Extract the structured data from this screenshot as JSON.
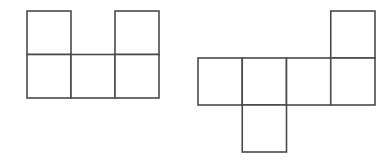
{
  "canvas": {
    "width": 388,
    "height": 165,
    "background_color": "#ffffff"
  },
  "style": {
    "stroke_color": "#4a4a4a",
    "fill_color": "#ffffff",
    "stroke_width": 1.6,
    "cell_size": 44
  },
  "figures": [
    {
      "name": "left-net",
      "label": "",
      "square_count": 5,
      "origin_x": 27,
      "origin_y": 11,
      "cell_width": 44,
      "cell_height": 43.5,
      "grid_cells": [
        {
          "col": 0,
          "row": 0
        },
        {
          "col": 2,
          "row": 0
        },
        {
          "col": 0,
          "row": 1
        },
        {
          "col": 1,
          "row": 1
        },
        {
          "col": 2,
          "row": 1
        }
      ]
    },
    {
      "name": "right-net",
      "label": "",
      "square_count": 6,
      "origin_x": 198,
      "origin_y": 11,
      "cell_width": 44.25,
      "cell_height": 47,
      "grid_cells": [
        {
          "col": 3,
          "row": 0
        },
        {
          "col": 0,
          "row": 1
        },
        {
          "col": 1,
          "row": 1
        },
        {
          "col": 2,
          "row": 1
        },
        {
          "col": 3,
          "row": 1
        },
        {
          "col": 1,
          "row": 2
        }
      ]
    }
  ]
}
